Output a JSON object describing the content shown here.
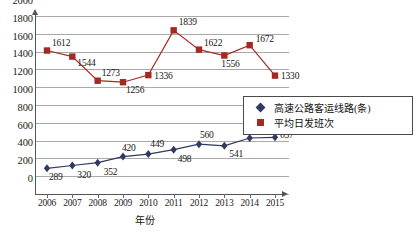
{
  "chart_data": {
    "type": "line",
    "title": "",
    "xlabel": "年份",
    "ylabel": "",
    "categories": [
      "2006",
      "2007",
      "2008",
      "2009",
      "2010",
      "2011",
      "2012",
      "2013",
      "2014",
      "2015"
    ],
    "ylim": [
      0,
      2000
    ],
    "ytick_step": 200,
    "yticks": [
      "0",
      "200",
      "400",
      "600",
      "800",
      "1000",
      "1200",
      "1400",
      "1600",
      "1800",
      "2000"
    ],
    "grid": true,
    "legend_position": "right-middle",
    "series": [
      {
        "name": "高速公路客运线路(条)",
        "marker": "diamond",
        "color": "#31395e",
        "values": [
          289,
          320,
          352,
          420,
          449,
          498,
          560,
          541,
          629,
          637
        ],
        "labels": [
          "289",
          "320",
          "352",
          "420",
          "449",
          "498",
          "560",
          "541",
          "629",
          "637"
        ]
      },
      {
        "name": "平均日发班次",
        "marker": "square",
        "color": "#a32a22",
        "values": [
          1612,
          1544,
          1273,
          1256,
          1336,
          1839,
          1622,
          1556,
          1672,
          1330
        ],
        "labels": [
          "1612",
          "1544",
          "1273",
          "1256",
          "1336",
          "1839",
          "1622",
          "1556",
          "1672",
          "1330"
        ]
      }
    ]
  },
  "legend": {
    "items": [
      {
        "label": "高速公路客运线路(条)",
        "marker": "diamond",
        "color": "#31395e"
      },
      {
        "label": "平均日发班次",
        "marker": "square",
        "color": "#a32a22"
      }
    ]
  },
  "axis": {
    "x_title": "年份",
    "x_labels": [
      "2006",
      "2007",
      "2008",
      "2009",
      "2010",
      "2011",
      "2012",
      "2013",
      "2014",
      "2015"
    ],
    "y_labels": [
      "2000",
      "1800",
      "1600",
      "1400",
      "1200",
      "1000",
      "800",
      "600",
      "400",
      "200",
      "0"
    ]
  },
  "colors": {
    "series_blue": "#31395e",
    "series_red": "#a32a22",
    "gridline": "#a9a9a9",
    "axis": "#555555",
    "background": "#ffffff"
  }
}
